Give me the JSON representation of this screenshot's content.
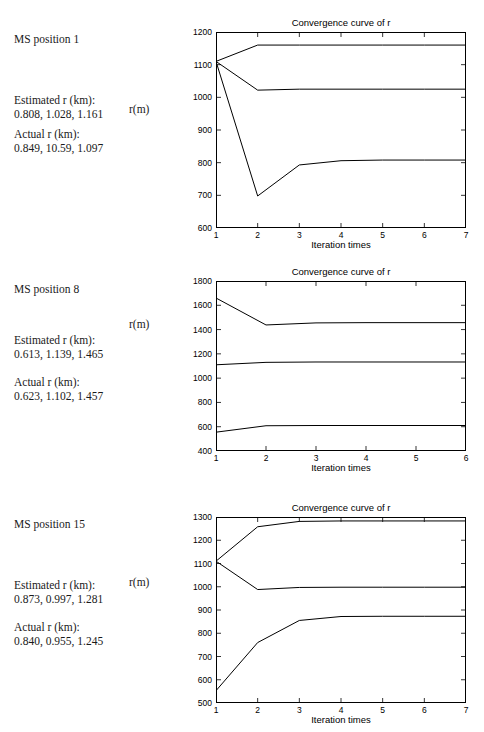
{
  "figure": {
    "background": "#ffffff",
    "line_color": "#000000",
    "axis_color": "#000000"
  },
  "panels": [
    {
      "ms_label": "MS position 1",
      "estimated_header": "Estimated r (km):",
      "estimated_values": "0.808, 1.028,  1.161",
      "actual_header": "Actual r (km):",
      "actual_values": "0.849, 10.59, 1.097",
      "ylabel": "r(m)"
    },
    {
      "ms_label": "MS position 8",
      "estimated_header": "Estimated r (km):",
      "estimated_values": "0.613, 1.139, 1.465",
      "actual_header": "Actual r (km):",
      "actual_values": "0.623, 1.102, 1.457",
      "ylabel": "r(m)"
    },
    {
      "ms_label": "MS position 15",
      "estimated_header": "Estimated r (km):",
      "estimated_values": "0.873, 0.997, 1.281",
      "actual_header": "Actual r (km):",
      "actual_values": "0.840, 0.955, 1.245",
      "ylabel": "r(m)"
    }
  ],
  "chart_data": [
    {
      "type": "line",
      "title": "Convergence curve of r",
      "xlabel": "Iteration times",
      "ylabel": "r(m)",
      "x": [
        1,
        2,
        3,
        4,
        5,
        6,
        7
      ],
      "xlim": [
        1,
        7
      ],
      "ylim": [
        600,
        1200
      ],
      "xticks": [
        1,
        2,
        3,
        4,
        5,
        6,
        7
      ],
      "yticks": [
        600,
        700,
        800,
        900,
        1000,
        1100,
        1200
      ],
      "grid": false,
      "legend": "none",
      "series": [
        {
          "name": "r3",
          "values": [
            1110,
            1160,
            1160,
            1160,
            1160,
            1160,
            1160
          ]
        },
        {
          "name": "r2",
          "values": [
            1110,
            1022,
            1025,
            1025,
            1025,
            1025,
            1025
          ]
        },
        {
          "name": "r1",
          "values": [
            1110,
            698,
            793,
            806,
            808,
            808,
            808
          ]
        }
      ]
    },
    {
      "type": "line",
      "title": "Convergence curve of r",
      "xlabel": "Iteration times",
      "ylabel": "r(m)",
      "x": [
        1,
        2,
        3,
        4,
        5,
        6
      ],
      "xlim": [
        1,
        6
      ],
      "ylim": [
        400,
        1800
      ],
      "xticks": [
        1,
        2,
        3,
        4,
        5,
        6
      ],
      "yticks": [
        400,
        600,
        800,
        1000,
        1200,
        1400,
        1600,
        1800
      ],
      "grid": false,
      "legend": "none",
      "series": [
        {
          "name": "r3",
          "values": [
            1660,
            1438,
            1455,
            1457,
            1457,
            1457
          ]
        },
        {
          "name": "r2",
          "values": [
            1110,
            1130,
            1133,
            1133,
            1133,
            1133
          ]
        },
        {
          "name": "r1",
          "values": [
            555,
            608,
            610,
            610,
            610,
            610
          ]
        }
      ]
    },
    {
      "type": "line",
      "title": "Convergence curve of r",
      "xlabel": "Iteration times",
      "ylabel": "r(m)",
      "x": [
        1,
        2,
        3,
        4,
        5,
        6,
        7
      ],
      "xlim": [
        1,
        7
      ],
      "ylim": [
        500,
        1300
      ],
      "xticks": [
        1,
        2,
        3,
        4,
        5,
        6,
        7
      ],
      "yticks": [
        500,
        600,
        700,
        800,
        900,
        1000,
        1100,
        1200,
        1300
      ],
      "grid": false,
      "legend": "none",
      "series": [
        {
          "name": "r3",
          "values": [
            1110,
            1258,
            1281,
            1283,
            1283,
            1283,
            1283
          ]
        },
        {
          "name": "r2",
          "values": [
            1110,
            988,
            997,
            998,
            998,
            998,
            998
          ]
        },
        {
          "name": "r1",
          "values": [
            553,
            760,
            855,
            872,
            873,
            873,
            873
          ]
        }
      ]
    }
  ]
}
